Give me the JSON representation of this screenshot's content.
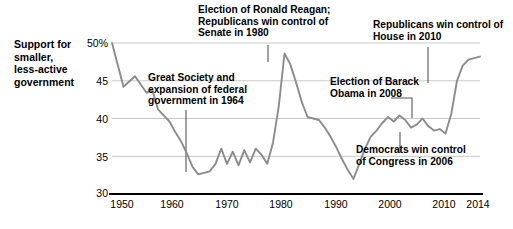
{
  "y_axis": {
    "caption": "Support for smaller, less-active government",
    "caption_lines": [
      "Support for",
      "smaller,",
      "less-active",
      "government"
    ],
    "ticks": [
      {
        "value": 50,
        "label": "50%"
      },
      {
        "value": 45,
        "label": "45"
      },
      {
        "value": 40,
        "label": "40"
      },
      {
        "value": 35,
        "label": "35"
      },
      {
        "value": 30,
        "label": "30"
      }
    ]
  },
  "x_axis": {
    "ticks": [
      {
        "value": 1950,
        "label": "1950"
      },
      {
        "value": 1960,
        "label": "1960"
      },
      {
        "value": 1970,
        "label": "1970"
      },
      {
        "value": 1980,
        "label": "1980"
      },
      {
        "value": 1990,
        "label": "1990"
      },
      {
        "value": 2000,
        "label": "2000"
      },
      {
        "value": 2010,
        "label": "2010"
      },
      {
        "value": 2014,
        "label": "2014"
      }
    ]
  },
  "annotations": {
    "great_society": "Great Society and expansion of federal government in 1964",
    "reagan": "Election of Ronald Reagan; Republicans win control of Senate in 1980",
    "house_2010": "Republicans win control of House in 2010",
    "obama": "Election of Barack Obama in 2008",
    "democrats_2006": "Democrats win control of Congress in 2006"
  },
  "colors": {
    "line": "#8c8c8c",
    "grid": "#c9c9c9",
    "axis": "#000000",
    "text": "#000000",
    "leader": "#4d4d4d",
    "background": "#ffffff"
  },
  "chart_data": {
    "type": "line",
    "title": "",
    "xlabel": "",
    "ylabel": "Support for smaller, less-active government",
    "xlim": [
      1950,
      2014
    ],
    "ylim": [
      30,
      50
    ],
    "grid": true,
    "gridlines_y": [
      35,
      40,
      45,
      50
    ],
    "legend": "none",
    "series": [
      {
        "name": "Support for smaller, less-active government",
        "color": "#8c8c8c",
        "x": [
          1950,
          1952,
          1954,
          1956,
          1957,
          1958,
          1960,
          1961,
          1962,
          1963,
          1964,
          1965,
          1966,
          1967,
          1968,
          1969,
          1970,
          1971,
          1972,
          1973,
          1974,
          1975,
          1976,
          1977,
          1978,
          1979,
          1980,
          1981,
          1982,
          1983,
          1984,
          1985,
          1986,
          1987,
          1988,
          1989,
          1990,
          1991,
          1992,
          1993,
          1994,
          1995,
          1996,
          1997,
          1998,
          1999,
          2000,
          2001,
          2002,
          2003,
          2004,
          2005,
          2006,
          2007,
          2008,
          2009,
          2010,
          2011,
          2012,
          2013,
          2014
        ],
        "y": [
          50.0,
          44.2,
          45.6,
          43.4,
          43.8,
          41.2,
          39.6,
          38.2,
          37.0,
          35.4,
          33.6,
          32.6,
          32.8,
          33.0,
          34.0,
          36.0,
          34.0,
          35.6,
          33.8,
          35.8,
          34.2,
          36.0,
          35.2,
          34.0,
          36.8,
          41.6,
          48.6,
          47.2,
          44.8,
          42.2,
          40.2,
          40.0,
          39.8,
          38.8,
          37.6,
          36.2,
          34.6,
          33.2,
          32.0,
          34.0,
          36.0,
          37.6,
          38.4,
          39.4,
          40.2,
          39.6,
          40.4,
          39.8,
          38.8,
          39.2,
          40.0,
          39.0,
          38.4,
          38.6,
          38.0,
          40.6,
          45.0,
          47.0,
          47.8,
          48.0,
          48.2
        ]
      }
    ],
    "annotations": [
      {
        "text": "Great Society and expansion of federal government in 1964",
        "year": 1964
      },
      {
        "text": "Election of Ronald Reagan; Republicans win control of Senate in 1980",
        "year": 1980
      },
      {
        "text": "Republicans win control of House in 2010",
        "year": 2010
      },
      {
        "text": "Election of Barack Obama in 2008",
        "year": 2008
      },
      {
        "text": "Democrats win control of Congress in 2006",
        "year": 2006
      }
    ]
  }
}
